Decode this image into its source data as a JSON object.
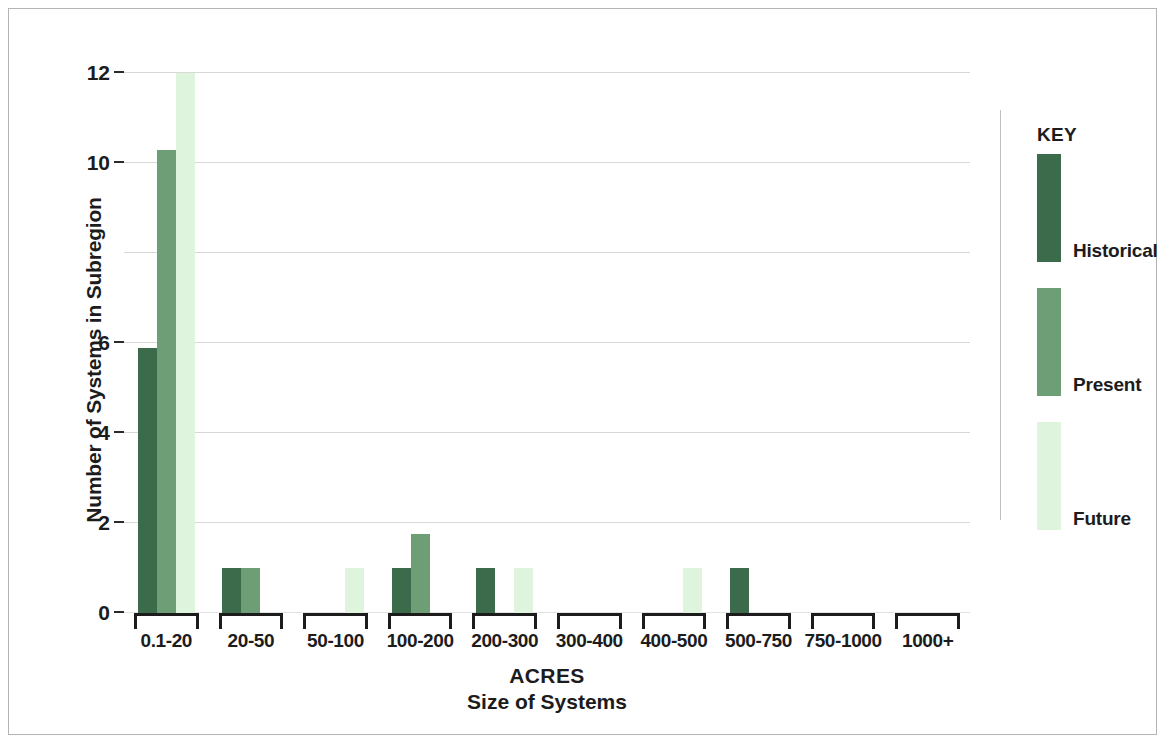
{
  "chart_data": {
    "type": "bar",
    "title": "",
    "xlabel": "ACRES",
    "xlabel_sub": "Size of Systems",
    "ylabel": "Number of Systems in Subregion",
    "categories": [
      "0.1-20",
      "20-50",
      "50-100",
      "100-200",
      "200-300",
      "300-400",
      "400-500",
      "500-750",
      "750-1000",
      "1000+"
    ],
    "series": [
      {
        "name": "Historical",
        "color": "#3c6b4c",
        "values": [
          5.9,
          1,
          0,
          1,
          1,
          0,
          0,
          1,
          0,
          0
        ]
      },
      {
        "name": "Present",
        "color": "#6d9e75",
        "values": [
          10.3,
          1,
          0,
          1.75,
          0,
          0,
          0,
          0,
          0,
          0
        ]
      },
      {
        "name": "Future",
        "color": "#dff4dc",
        "values": [
          12,
          0,
          1,
          0,
          1,
          0,
          1,
          0,
          0,
          0
        ]
      }
    ],
    "ylim": [
      0,
      12
    ],
    "yticks": [
      0,
      2,
      4,
      6,
      8,
      10,
      12
    ],
    "ytick_labels": [
      "0",
      "2",
      "4",
      "6",
      "",
      "10",
      "12"
    ],
    "grid": true,
    "legend_position": "right",
    "legend_title": "KEY"
  },
  "legend": {
    "title": "KEY",
    "entries": [
      {
        "label": "Historical",
        "color": "#3c6b4c"
      },
      {
        "label": "Present",
        "color": "#6d9e75"
      },
      {
        "label": "Future",
        "color": "#dff4dc"
      }
    ]
  },
  "axes": {
    "y_title": "Number of Systems in Subregion",
    "x_title_line1": "ACRES",
    "x_title_line2": "Size of Systems"
  },
  "colors": {
    "historical": "#3c6b4c",
    "present": "#6d9e75",
    "future": "#dff4dc",
    "gridline": "#d8d8d8",
    "axis": "#1c1c1c",
    "frame": "#b4b4b4"
  }
}
